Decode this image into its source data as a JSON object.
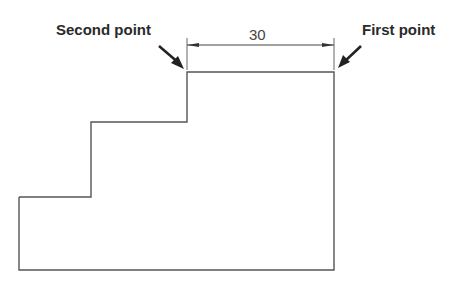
{
  "diagram": {
    "labels": {
      "second_point": "Second point",
      "first_point": "First point"
    },
    "dimension": {
      "value": "30"
    },
    "colors": {
      "line": "#555555",
      "text": "#2a2a2a",
      "background": "#ffffff"
    },
    "shape": {
      "type": "stepped-profile",
      "points": [
        [
          19,
          197
        ],
        [
          91,
          197
        ],
        [
          91,
          122
        ],
        [
          187,
          122
        ],
        [
          187,
          72
        ],
        [
          334,
          72
        ],
        [
          334,
          270
        ],
        [
          19,
          270
        ]
      ]
    }
  }
}
